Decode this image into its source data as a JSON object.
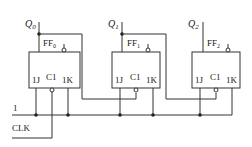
{
  "flip_flops": [
    {
      "name": "FF",
      "sub": "0",
      "output": "Q",
      "output_sub": "0",
      "j": "1J",
      "clk": "C1",
      "k": "1K"
    },
    {
      "name": "FF",
      "sub": "1",
      "output": "Q",
      "output_sub": "1",
      "j": "1J",
      "clk": "C1",
      "k": "1K"
    },
    {
      "name": "FF",
      "sub": "2",
      "output": "Q",
      "output_sub": "2",
      "j": "1J",
      "clk": "C1",
      "k": "1K"
    }
  ],
  "inputs": {
    "logic_one": "1",
    "clock": "CLK"
  },
  "colors": {
    "line": "#333333",
    "background": "#ffffff"
  }
}
